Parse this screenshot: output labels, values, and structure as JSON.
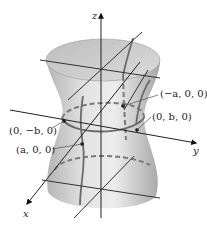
{
  "figure": {
    "axes": {
      "x_label": "x",
      "y_label": "y",
      "z_label": "z"
    },
    "points": [
      {
        "id": "neg_a",
        "label": "(−a, 0, 0)"
      },
      {
        "id": "pos_b",
        "label": "(0, b, 0)"
      },
      {
        "id": "neg_b",
        "label": "(0, −b, 0)"
      },
      {
        "id": "pos_a",
        "label": "(a, 0, 0)"
      }
    ],
    "colors": {
      "surface_light": "#e6e6e6",
      "surface_dark": "#a9a9a9",
      "top_cap": "#c8c8c8",
      "lines": "#333333",
      "dashed": "#7a7a7a",
      "trace": "#6b6b6b"
    }
  }
}
